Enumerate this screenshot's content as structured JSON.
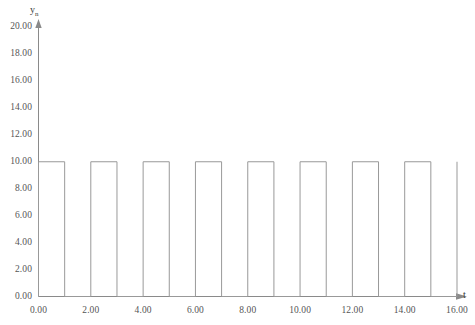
{
  "chart_data": {
    "type": "line",
    "title": "",
    "subtitle": "",
    "xlabel": "t",
    "ylabel": "y",
    "ylabel_subscript": "n",
    "xlim": [
      0.0,
      16.0
    ],
    "ylim": [
      0.0,
      20.0
    ],
    "xticks": [
      0.0,
      2.0,
      4.0,
      6.0,
      8.0,
      10.0,
      12.0,
      14.0,
      16.0
    ],
    "yticks": [
      0.0,
      2.0,
      4.0,
      6.0,
      8.0,
      10.0,
      12.0,
      14.0,
      16.0,
      18.0,
      20.0
    ],
    "xtick_labels": [
      "0.00",
      "2.00",
      "4.00",
      "6.00",
      "8.00",
      "10.00",
      "12.00",
      "14.00",
      "16.00"
    ],
    "ytick_labels": [
      "0.00",
      "2.00",
      "4.00",
      "6.00",
      "8.00",
      "10.00",
      "12.00",
      "14.00",
      "16.00",
      "18.00",
      "20.00"
    ],
    "grid": false,
    "legend": false,
    "legend_position": "none",
    "line_color": "#999999",
    "axis_color": "#8a8a8a",
    "background_color": "#ffffff",
    "waveform": {
      "shape": "square",
      "amplitude": 10.0,
      "low_level": 0.0,
      "high_level": 10.0,
      "period": 2.0,
      "duty_cycle": 0.5,
      "pulse_count": 8,
      "description": "Square wave, high on [0,1],[2,3],[4,5],[6,7],[8,9],[10,11],[12,13],[14,15]"
    },
    "series": [
      {
        "name": "yn",
        "points": [
          [
            0.0,
            0.0
          ],
          [
            0.0,
            10.0
          ],
          [
            1.0,
            10.0
          ],
          [
            1.0,
            0.0
          ],
          [
            2.0,
            0.0
          ],
          [
            2.0,
            10.0
          ],
          [
            3.0,
            10.0
          ],
          [
            3.0,
            0.0
          ],
          [
            4.0,
            0.0
          ],
          [
            4.0,
            10.0
          ],
          [
            5.0,
            10.0
          ],
          [
            5.0,
            0.0
          ],
          [
            6.0,
            0.0
          ],
          [
            6.0,
            10.0
          ],
          [
            7.0,
            10.0
          ],
          [
            7.0,
            0.0
          ],
          [
            8.0,
            0.0
          ],
          [
            8.0,
            10.0
          ],
          [
            9.0,
            10.0
          ],
          [
            9.0,
            0.0
          ],
          [
            10.0,
            0.0
          ],
          [
            10.0,
            10.0
          ],
          [
            11.0,
            10.0
          ],
          [
            11.0,
            0.0
          ],
          [
            12.0,
            0.0
          ],
          [
            12.0,
            10.0
          ],
          [
            13.0,
            10.0
          ],
          [
            13.0,
            0.0
          ],
          [
            14.0,
            0.0
          ],
          [
            14.0,
            10.0
          ],
          [
            15.0,
            10.0
          ],
          [
            15.0,
            0.0
          ],
          [
            16.0,
            0.0
          ],
          [
            16.0,
            10.0
          ]
        ]
      }
    ]
  }
}
